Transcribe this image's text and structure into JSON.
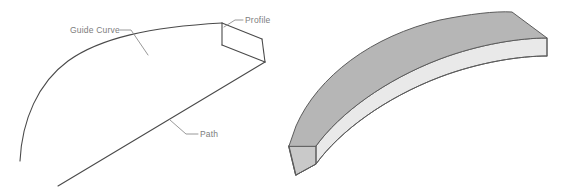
{
  "figure": {
    "background_color": "#ffffff",
    "width": 570,
    "height": 195
  },
  "left_panel": {
    "name": "wireframe-construction-diagram",
    "description": "Wireframe showing a profile swept along a path guided by a guide curve",
    "line_color": "#4a4a4a",
    "leader_color": "#8d8d8d",
    "labels": [
      {
        "id": "guide-curve",
        "text": "Guide Curve",
        "x": 70,
        "y": 33,
        "anchor": "start"
      },
      {
        "id": "profile",
        "text": "Profile",
        "x": 245,
        "y": 23,
        "anchor": "start"
      },
      {
        "id": "path",
        "text": "Path",
        "x": 200,
        "y": 137,
        "anchor": "start"
      }
    ],
    "geometry": {
      "guide_curve_path": "M 20,161 C 22,120 38,83 68,61 C 100,38 150,27 222,23",
      "path_line": "M 58,186 L 265,62",
      "profile_quad": "M 222,23 L 262,39 L 265,62 L 222,45 Z",
      "profile_top_edge": "M 222,23 L 262,39",
      "profile_left_edge": "M 222,23 L 222,45",
      "profile_right_edge": "M 262,39 L 265,62",
      "profile_bottom_edge": "M 222,45 L 265,62",
      "guide_end_tie": "M 222,23 L 222,45",
      "leader_guide": "M 120,30 L 131,30 L 148,55",
      "leader_profile": "M 243,20 L 235,20 L 224,27",
      "leader_path": "M 198,134 L 186,134 L 170,120"
    }
  },
  "right_panel": {
    "name": "solid-sweep-result",
    "description": "Resulting curved slab solid produced by the sweep",
    "colors": {
      "top_face": "#b6b6b6",
      "front_face": "#e9e9e9",
      "end_cap_face": "#c9c9c9",
      "edge": "#5c5c5c"
    },
    "geometry": {
      "top_face": "M 289,146 L 296,126 C 318,76 372,36 440,20 C 470,14 495,11 512,12 L 547,38 C 520,38 480,44 440,59 C 385,80 340,113 316,146 Z",
      "front_face": "M 289,146 L 316,146 C 340,113 385,80 440,59 C 480,44 520,38 547,38 L 547,56 C 520,56 480,62 440,77 C 385,98 340,131 316,164 L 296,175 Z",
      "end_cap_face": "M 289,146 L 316,146 L 316,164 L 296,175 Z",
      "top_outer_edge": "M 289,146 L 296,126 C 318,76 372,36 440,20 C 470,14 495,11 512,12",
      "top_right_edge": "M 512,12 L 547,38",
      "top_inner_edge": "M 547,38 C 520,38 480,44 440,59 C 385,80 340,113 316,146 L 289,146",
      "bottom_inner_edge": "M 547,56 C 520,56 480,62 440,77 C 385,98 340,131 316,164 L 296,175",
      "right_vertical_edge": "M 547,38 L 547,56",
      "left_vertical_edge": "M 289,146 L 296,175",
      "end_cap_edge": "M 316,146 L 316,164",
      "bottom_left_edge": "M 296,175 L 316,164"
    }
  }
}
